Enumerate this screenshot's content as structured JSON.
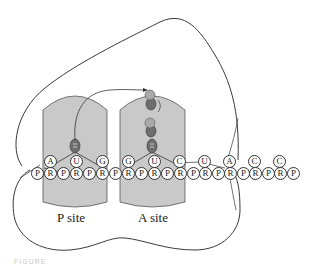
{
  "diagram": {
    "type": "ribosome-translation",
    "sites": [
      {
        "id": "p_site",
        "label": "P site"
      },
      {
        "id": "a_site",
        "label": "A site"
      }
    ],
    "mrna_bases": [
      "A",
      "U",
      "G",
      "G",
      "U",
      "C",
      "U",
      "A",
      "C",
      "C"
    ],
    "backbone": [
      "P",
      "R",
      "P",
      "R",
      "P",
      "R",
      "P",
      "R",
      "P",
      "R",
      "P",
      "R",
      "P",
      "R",
      "P",
      "R",
      "P",
      "R",
      "P",
      "R",
      "P"
    ],
    "colors": {
      "site_fill": "#c9c9c9",
      "outline": "#3a3a3a",
      "trna": "#6e6e6e",
      "amino_acid": "#a9a9a9"
    },
    "caption": "FIGURE"
  }
}
